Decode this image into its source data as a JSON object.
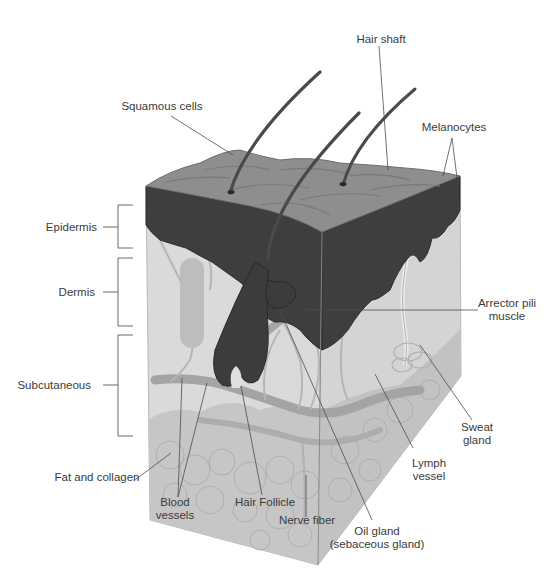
{
  "diagram": {
    "colors": {
      "background": "#ffffff",
      "top_surface": "#8f8f8f",
      "epidermis": "#3f3f3f",
      "dermis_front": "#dcdcdc",
      "dermis_side": "#d2d2d2",
      "subcutaneous": "#c4c4c4",
      "hair": "#4a4a4a",
      "vessel": "#9e9e9e",
      "leader_line": "#4d4d4d",
      "label_text": "#3a3a3a"
    },
    "layer_brackets": [
      {
        "label": "Epidermis",
        "y_top": 205,
        "y_bottom": 248
      },
      {
        "label": "Dermis",
        "y_top": 258,
        "y_bottom": 326
      },
      {
        "label": "Subcutaneous",
        "y_top": 335,
        "y_bottom": 436
      }
    ],
    "labels": {
      "hair_shaft": "Hair shaft",
      "squamous_cells": "Squamous cells",
      "melanocytes": "Melanocytes",
      "epidermis": "Epidermis",
      "dermis": "Dermis",
      "subcutaneous": "Subcutaneous",
      "arrector_pili_line1": "Arrector pili",
      "arrector_pili_line2": "muscle",
      "sweat_gland_line1": "Sweat",
      "sweat_gland_line2": "gland",
      "lymph_vessel_line1": "Lymph",
      "lymph_vessel_line2": "vessel",
      "fat_and_collagen": "Fat and collagen",
      "blood_vessels_line1": "Blood",
      "blood_vessels_line2": "vessels",
      "hair_follicle": "Hair Follicle",
      "nerve_fiber": "Nerve fiber",
      "oil_gland_line1": "Oil gland",
      "oil_gland_line2": "(sebaceous gland)"
    }
  }
}
